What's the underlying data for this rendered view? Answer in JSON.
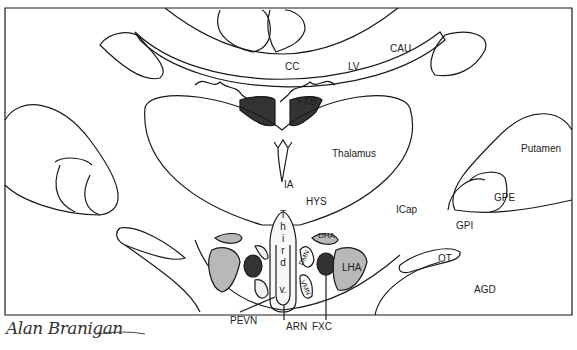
{
  "diagram": {
    "type": "anatomical coronal section (brain)",
    "labels": {
      "cc": "CC",
      "lv": "LV",
      "cau": "CAU",
      "fxb": "FXB",
      "thalamus": "Thalamus",
      "ia": "IA",
      "hys": "HYS",
      "icap": "ICap",
      "putamen": "Putamen",
      "gpe": "GPE",
      "gpi": "GPI",
      "dha": "DHA",
      "dmn": "DMN",
      "vmn": "VMN",
      "lha": "LHA",
      "ot": "OT",
      "agd": "AGD",
      "pevn": "PEVN",
      "arn": "ARN",
      "fxc": "FXC"
    },
    "third_ventricle": [
      "T",
      "h",
      "i",
      "r",
      "d",
      "v."
    ],
    "signature": "Alan Branigan",
    "colors": {
      "line": "#1a1a1a",
      "dark_fill": "#333333",
      "gray_fill": "#b8b8b8",
      "light_fill": "#f0f0f0"
    }
  }
}
